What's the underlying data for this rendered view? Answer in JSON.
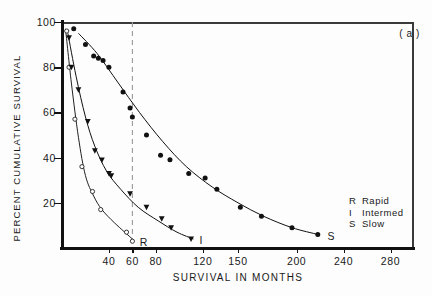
{
  "figure": {
    "panel_label": "( a )",
    "background": "#fdfdfd",
    "ink_color": "#111111"
  },
  "axes": {
    "ylabel": "PERCENT CUMULATIVE SURVIVAL",
    "xlabel": "SURVIVAL IN MONTHS",
    "y_ticks": [
      20,
      40,
      60,
      80,
      100
    ],
    "y_tick_labels": [
      "20",
      "40",
      "60",
      "80",
      "100"
    ],
    "x_ticks": [
      40,
      60,
      80,
      120,
      150,
      200,
      240,
      280
    ],
    "x_tick_labels": [
      "40",
      "60",
      "80",
      "120",
      "150",
      "200",
      "240",
      "280"
    ],
    "xlim": [
      0,
      300
    ],
    "ylim": [
      0,
      100
    ]
  },
  "legend": {
    "position": "inside-right",
    "entries": [
      {
        "symbol": "R",
        "label": "Rapid"
      },
      {
        "symbol": "I",
        "label": "Intermed"
      },
      {
        "symbol": "S",
        "label": "Slow"
      }
    ]
  },
  "annotations": {
    "curve_end_labels": [
      {
        "text": "R",
        "x": 62,
        "y": 2
      },
      {
        "text": "I",
        "x": 113,
        "y": 3
      },
      {
        "text": "S",
        "x": 222,
        "y": 5
      }
    ],
    "reference_line": {
      "orientation": "vertical",
      "x": 60,
      "style": "dashed",
      "color": "#999999"
    }
  },
  "chart_data": {
    "type": "scatter",
    "title": "",
    "subtitle": "",
    "xlabel": "SURVIVAL IN MONTHS",
    "ylabel": "PERCENT CUMULATIVE SURVIVAL",
    "xlim": [
      0,
      300
    ],
    "ylim": [
      0,
      100
    ],
    "grid": false,
    "legend_position": "inside-right",
    "annotations": [
      "( a )",
      "R",
      "I",
      "S"
    ],
    "series": [
      {
        "name": "Rapid",
        "symbol": "R",
        "marker": "open-circle",
        "color": "#222222",
        "points": [
          {
            "x": 4,
            "y": 96
          },
          {
            "x": 6,
            "y": 80
          },
          {
            "x": 11,
            "y": 57
          },
          {
            "x": 17,
            "y": 36
          },
          {
            "x": 26,
            "y": 25
          },
          {
            "x": 33,
            "y": 17
          },
          {
            "x": 55,
            "y": 7
          },
          {
            "x": 60,
            "y": 3
          }
        ],
        "fit_curve": [
          {
            "x": 3,
            "y": 97
          },
          {
            "x": 8,
            "y": 73
          },
          {
            "x": 14,
            "y": 49
          },
          {
            "x": 20,
            "y": 32
          },
          {
            "x": 27,
            "y": 23
          },
          {
            "x": 34,
            "y": 17
          },
          {
            "x": 45,
            "y": 11
          },
          {
            "x": 60,
            "y": 4
          }
        ]
      },
      {
        "name": "Intermed",
        "symbol": "I",
        "marker": "filled-triangle-down",
        "color": "#111111",
        "points": [
          {
            "x": 6,
            "y": 93
          },
          {
            "x": 8,
            "y": 80
          },
          {
            "x": 14,
            "y": 70
          },
          {
            "x": 22,
            "y": 56
          },
          {
            "x": 28,
            "y": 43
          },
          {
            "x": 34,
            "y": 39
          },
          {
            "x": 40,
            "y": 33
          },
          {
            "x": 42,
            "y": 32
          },
          {
            "x": 58,
            "y": 24
          },
          {
            "x": 72,
            "y": 18
          },
          {
            "x": 85,
            "y": 13
          },
          {
            "x": 93,
            "y": 9
          },
          {
            "x": 110,
            "y": 4
          }
        ],
        "fit_curve": [
          {
            "x": 5,
            "y": 95
          },
          {
            "x": 12,
            "y": 76
          },
          {
            "x": 20,
            "y": 58
          },
          {
            "x": 28,
            "y": 45
          },
          {
            "x": 38,
            "y": 34
          },
          {
            "x": 50,
            "y": 26
          },
          {
            "x": 65,
            "y": 18
          },
          {
            "x": 82,
            "y": 12
          },
          {
            "x": 98,
            "y": 7
          },
          {
            "x": 112,
            "y": 4
          }
        ]
      },
      {
        "name": "Slow",
        "symbol": "S",
        "marker": "filled-circle",
        "color": "#111111",
        "points": [
          {
            "x": 10,
            "y": 97
          },
          {
            "x": 20,
            "y": 90
          },
          {
            "x": 27,
            "y": 85
          },
          {
            "x": 31,
            "y": 84
          },
          {
            "x": 35,
            "y": 83
          },
          {
            "x": 40,
            "y": 80
          },
          {
            "x": 52,
            "y": 69
          },
          {
            "x": 58,
            "y": 62
          },
          {
            "x": 60,
            "y": 58
          },
          {
            "x": 72,
            "y": 50
          },
          {
            "x": 84,
            "y": 41
          },
          {
            "x": 92,
            "y": 39
          },
          {
            "x": 108,
            "y": 33
          },
          {
            "x": 122,
            "y": 31
          },
          {
            "x": 132,
            "y": 26
          },
          {
            "x": 152,
            "y": 18
          },
          {
            "x": 170,
            "y": 14
          },
          {
            "x": 196,
            "y": 9
          },
          {
            "x": 218,
            "y": 6
          }
        ],
        "fit_curve": [
          {
            "x": 14,
            "y": 95
          },
          {
            "x": 30,
            "y": 86
          },
          {
            "x": 48,
            "y": 73
          },
          {
            "x": 66,
            "y": 60
          },
          {
            "x": 86,
            "y": 47
          },
          {
            "x": 106,
            "y": 36
          },
          {
            "x": 128,
            "y": 27
          },
          {
            "x": 150,
            "y": 20
          },
          {
            "x": 172,
            "y": 14
          },
          {
            "x": 196,
            "y": 9
          },
          {
            "x": 218,
            "y": 6
          }
        ]
      }
    ]
  }
}
